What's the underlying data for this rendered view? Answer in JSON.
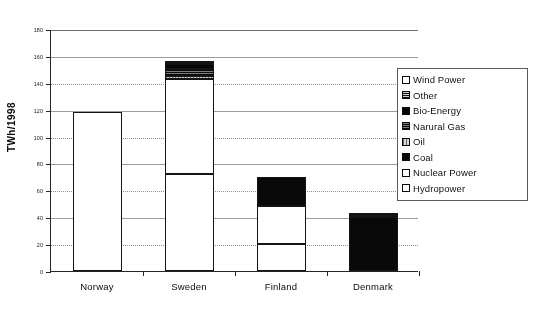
{
  "chart_data": {
    "type": "bar",
    "subtype": "stacked",
    "title": "",
    "xlabel": "",
    "ylabel": "TWh/1998",
    "ylim": [
      0,
      180
    ],
    "ytick_step": 20,
    "yticks": [
      "0",
      "20",
      "40",
      "60",
      "80",
      "100",
      "120",
      "140",
      "160",
      "180"
    ],
    "grid": true,
    "grid_axis": "y",
    "legend_position": "right",
    "categories": [
      "Norway",
      "Sweden",
      "Finland",
      "Denmark"
    ],
    "series": [
      {
        "name": "Hydropower",
        "key": "hydro",
        "swatch": "white",
        "values": [
          118,
          72,
          20,
          0
        ]
      },
      {
        "name": "Nuclear Power",
        "key": "nuclear",
        "swatch": "white",
        "values": [
          0,
          71,
          28,
          0
        ]
      },
      {
        "name": "Coal",
        "key": "coal",
        "swatch": "solid-black",
        "values": [
          0,
          0,
          22,
          40
        ]
      },
      {
        "name": "Oil",
        "key": "oil",
        "swatch": "light-hatch",
        "values": [
          0,
          2,
          0,
          1
        ]
      },
      {
        "name": "Narural Gas",
        "key": "gas",
        "swatch": "dark-horiz-lines",
        "values": [
          0,
          5,
          0,
          1
        ]
      },
      {
        "name": "Bio-Energy",
        "key": "bio",
        "swatch": "solid-black",
        "values": [
          0,
          4,
          0,
          0
        ]
      },
      {
        "name": "Other",
        "key": "other",
        "swatch": "gray-horiz-lines",
        "values": [
          0,
          2,
          0,
          0
        ]
      },
      {
        "name": "Wind Power",
        "key": "wind",
        "swatch": "white",
        "values": [
          0,
          0,
          0,
          1
        ]
      }
    ],
    "totals": [
      118,
      156,
      70,
      43
    ],
    "legend_order": [
      "Wind Power",
      "Other",
      "Bio-Energy",
      "Narural Gas",
      "Oil",
      "Coal",
      "Nuclear Power",
      "Hydropower"
    ]
  },
  "axis": {
    "y_title": "TWh/1998"
  },
  "legend": {
    "items": [
      {
        "label": "Wind Power",
        "swatch_class": "sw-wind"
      },
      {
        "label": "Other",
        "swatch_class": "sw-other"
      },
      {
        "label": "Bio-Energy",
        "swatch_class": "sw-bio"
      },
      {
        "label": "Narural Gas",
        "swatch_class": "sw-gas"
      },
      {
        "label": "Oil",
        "swatch_class": "sw-oil"
      },
      {
        "label": "Coal",
        "swatch_class": "sw-coal"
      },
      {
        "label": "Nuclear Power",
        "swatch_class": "sw-nuclear"
      },
      {
        "label": "Hydropower",
        "swatch_class": "sw-hydro"
      }
    ]
  },
  "style": {
    "axis_color": "#2a2a2a",
    "grid_color": "#8e8e8e",
    "text_color": "#111111",
    "bar_border": "#1a1a1a",
    "plot_background": "#ffffff"
  }
}
